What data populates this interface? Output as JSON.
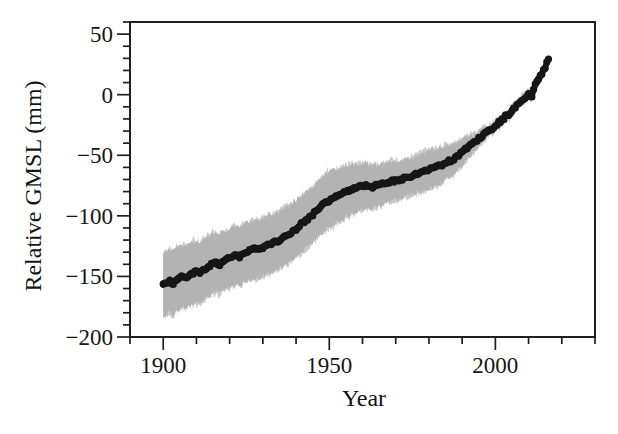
{
  "figure": {
    "background": "#ffffff",
    "ink_color": "#1a1a1a",
    "axis_color": "#1f1f1f"
  },
  "chart_data": {
    "type": "scatter",
    "title": "",
    "xlabel": "Year",
    "ylabel": "Relative GMSL (mm)",
    "xlim": [
      1890,
      2030
    ],
    "ylim": [
      -200,
      60
    ],
    "grid": false,
    "legend": null,
    "x_major_ticks": [
      1900,
      1950,
      2000
    ],
    "x_tick_labels": [
      "1900",
      "1950",
      "2000"
    ],
    "x_minor_step": 10,
    "y_major_ticks": [
      50,
      0,
      -50,
      -100,
      -150,
      -200
    ],
    "y_tick_labels": [
      "50",
      "0",
      "−50",
      "−100",
      "−150",
      "−200"
    ],
    "y_minor_step": 10,
    "series": [
      {
        "name": "GMSL reconstruction (annual means)",
        "style": "thick-dotted-line",
        "color": "#161616",
        "x_start": 1900,
        "x_step": 1,
        "y": [
          -157,
          -155,
          -154,
          -156,
          -152,
          -151,
          -150,
          -151,
          -148,
          -147,
          -146,
          -147,
          -144,
          -143,
          -141,
          -139,
          -139,
          -140,
          -137,
          -136,
          -135,
          -133,
          -133,
          -134,
          -131,
          -130,
          -129,
          -128,
          -127,
          -128,
          -126,
          -124,
          -124,
          -123,
          -121,
          -120,
          -118,
          -116,
          -115,
          -113,
          -111,
          -108,
          -106,
          -104,
          -101,
          -99,
          -96,
          -93,
          -91,
          -89,
          -87,
          -85,
          -84,
          -83,
          -82,
          -80,
          -79,
          -78,
          -77,
          -76,
          -76,
          -75,
          -76,
          -76,
          -75,
          -75,
          -74,
          -73,
          -72,
          -71,
          -71,
          -71,
          -70,
          -68,
          -68,
          -67,
          -66,
          -65,
          -64,
          -63,
          -62,
          -60,
          -60,
          -59,
          -58,
          -56,
          -55,
          -54,
          -52,
          -50,
          -48,
          -45,
          -43,
          -41,
          -39,
          -36,
          -34,
          -32,
          -30,
          -28,
          -26,
          -23,
          -21,
          -18,
          -16,
          -13,
          -10,
          -7,
          -5,
          -2,
          1,
          -1,
          8,
          12,
          18,
          23,
          29
        ]
      },
      {
        "name": "uncertainty band",
        "style": "band",
        "color": "#b3b3b3",
        "fuzz_color": "#cbcbcb",
        "anchors_year_halfwidth_mm": [
          [
            1900,
            26
          ],
          [
            1910,
            25
          ],
          [
            1920,
            24
          ],
          [
            1930,
            24
          ],
          [
            1940,
            23
          ],
          [
            1950,
            23
          ],
          [
            1955,
            21
          ],
          [
            1960,
            19
          ],
          [
            1965,
            17
          ],
          [
            1970,
            16
          ],
          [
            1975,
            15
          ],
          [
            1980,
            16
          ],
          [
            1985,
            14
          ],
          [
            1988,
            12
          ],
          [
            1990,
            11
          ],
          [
            1992,
            9
          ],
          [
            1994,
            7
          ],
          [
            1996,
            5
          ],
          [
            2000,
            4
          ],
          [
            2005,
            3
          ],
          [
            2016,
            3
          ]
        ]
      }
    ]
  }
}
